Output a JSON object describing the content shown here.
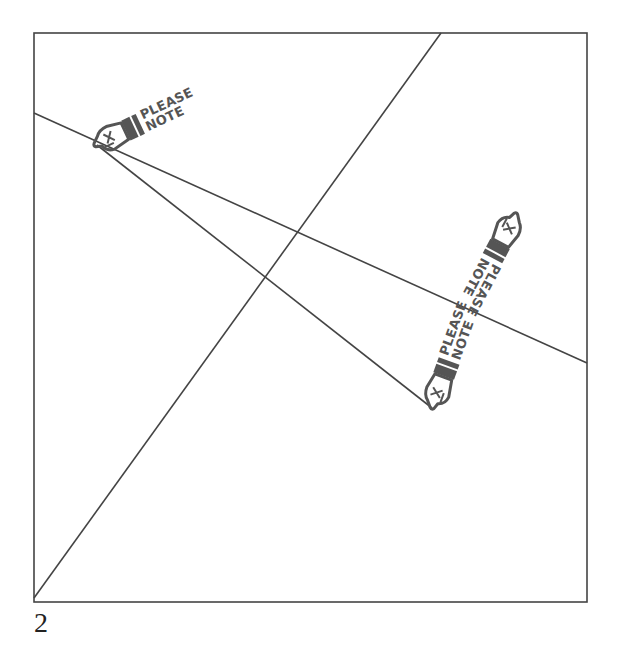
{
  "page_number": "2",
  "colors": {
    "frame": "#444444",
    "line": "#444444",
    "stamp": "#555555",
    "background": "#ffffff"
  },
  "frame": {
    "x": 34,
    "y": 33,
    "width": 553,
    "height": 569
  },
  "lines": [
    {
      "name": "line-a",
      "x1": 34,
      "y1": 598,
      "x2": 441,
      "y2": 33
    },
    {
      "name": "line-b",
      "x1": 34,
      "y1": 113,
      "x2": 587,
      "y2": 363
    },
    {
      "name": "line-c",
      "x1": 97,
      "y1": 145,
      "x2": 432,
      "y2": 408
    }
  ],
  "stamps": [
    {
      "name": "please-note-stamp-1",
      "line1": "PLEASE",
      "line2": "NOTE",
      "icon": "pointing-hand-icon"
    },
    {
      "name": "please-note-stamp-2",
      "line1": "PLEASE",
      "line2": "NOTE",
      "icon": "pointing-hand-icon"
    },
    {
      "name": "please-note-stamp-3",
      "line1": "PLEASE",
      "line2": "NOTE",
      "icon": "pointing-hand-icon"
    }
  ]
}
